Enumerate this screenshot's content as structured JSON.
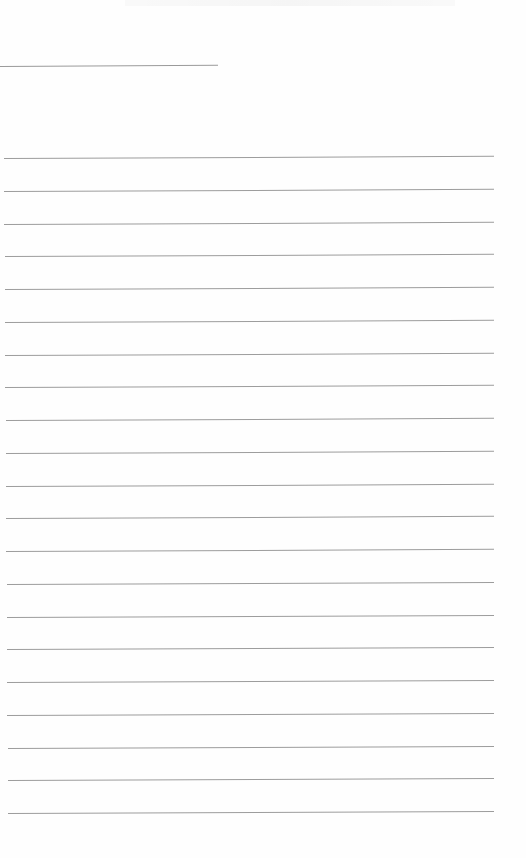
{
  "page": {
    "type": "lined-paper",
    "background_color": "#fefefe",
    "line_color": "#9c9c9c",
    "header_line": {
      "left": 0,
      "top": 66,
      "width": 218
    },
    "ruled_lines": {
      "count": 21,
      "first_top": 158,
      "spacing": 32.75,
      "left": 4,
      "right": 494
    }
  }
}
